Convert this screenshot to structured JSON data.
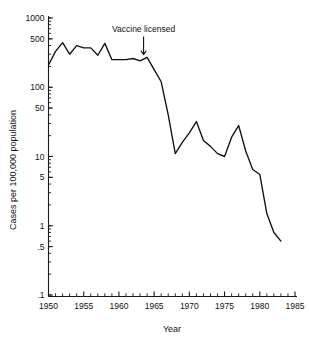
{
  "chart_data": {
    "type": "line",
    "title": "",
    "xlabel": "Year",
    "ylabel": "Cases per 100,000 population",
    "yscale": "log",
    "xlim": [
      1950,
      1985
    ],
    "ylim": [
      0.1,
      1000
    ],
    "grid": false,
    "legend": null,
    "x_ticks": [
      "1950",
      "1955",
      "1960",
      "1965",
      "1970",
      "1975",
      "1980",
      "1985"
    ],
    "x_tick_values": [
      1950,
      1955,
      1960,
      1965,
      1970,
      1975,
      1980,
      1985
    ],
    "x_minor_interval": 1,
    "y_ticks": [
      "1000",
      "500",
      "100",
      "50",
      "10",
      "5",
      "1",
      ".5",
      ".1"
    ],
    "y_tick_values": [
      1000,
      500,
      100,
      50,
      10,
      5,
      1,
      0.5,
      0.1
    ],
    "series": [
      {
        "name": "Measles incidence",
        "x": [
          1950,
          1951,
          1952,
          1953,
          1954,
          1955,
          1956,
          1957,
          1958,
          1959,
          1960,
          1961,
          1962,
          1963,
          1964,
          1965,
          1966,
          1967,
          1968,
          1969,
          1970,
          1971,
          1972,
          1973,
          1974,
          1975,
          1976,
          1977,
          1978,
          1979,
          1980,
          1981,
          1982,
          1983
        ],
        "values": [
          210,
          330,
          440,
          300,
          400,
          370,
          370,
          290,
          430,
          250,
          250,
          250,
          260,
          240,
          270,
          180,
          120,
          40,
          11,
          16,
          22,
          32,
          17,
          14,
          11,
          10,
          19,
          28,
          12,
          6.5,
          5.5,
          1.5,
          0.8,
          0.6
        ]
      }
    ],
    "annotations": [
      {
        "label": "Vaccine licensed",
        "x": 1963.5,
        "y": 260,
        "arrow": "down"
      }
    ]
  },
  "axes": {
    "x_title": "Year",
    "y_title": "Cases per 100,000 population"
  },
  "annotation": {
    "vaccine_label": "Vaccine licensed"
  },
  "colors": {
    "line": "#111111",
    "axis": "#1a1a1a",
    "background": "#ffffff",
    "text": "#111111"
  }
}
